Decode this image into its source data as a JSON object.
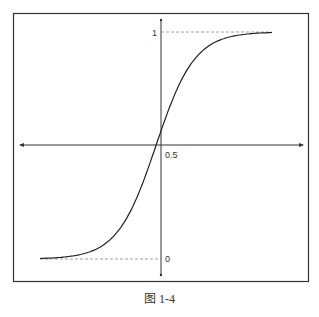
{
  "caption": "图   1-4",
  "chart_data": {
    "type": "line",
    "title": "",
    "xlabel": "",
    "ylabel": "",
    "y_tick_labels": [
      "1",
      "0.5",
      "0"
    ],
    "y_ticks": [
      1,
      0.5,
      0
    ],
    "ylim": [
      0,
      1
    ],
    "xlim": [
      -6,
      6
    ],
    "grid": false,
    "legend": null,
    "asymptote_lines": [
      {
        "y": 1,
        "style": "dashed"
      },
      {
        "y": 0,
        "style": "dashed"
      }
    ],
    "series": [
      {
        "name": "sigmoid",
        "x": [
          -6,
          -5,
          -4,
          -3,
          -2,
          -1,
          0,
          1,
          2,
          3,
          4,
          5,
          6
        ],
        "values": [
          0.002,
          0.007,
          0.018,
          0.047,
          0.12,
          0.27,
          0.5,
          0.73,
          0.88,
          0.953,
          0.982,
          0.993,
          0.998
        ]
      }
    ]
  }
}
